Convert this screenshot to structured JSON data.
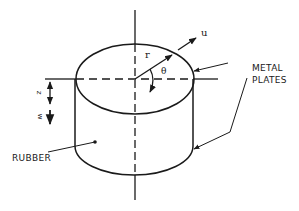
{
  "diagram": {
    "colors": {
      "stroke": "#1a1a1a",
      "background": "#ffffff"
    },
    "labels": {
      "u": "u",
      "r": "r",
      "theta": "θ",
      "z": "z",
      "w": "w",
      "metal_plates_line1": "METAL",
      "metal_plates_line2": "PLATES",
      "rubber": "RUBBER"
    }
  }
}
